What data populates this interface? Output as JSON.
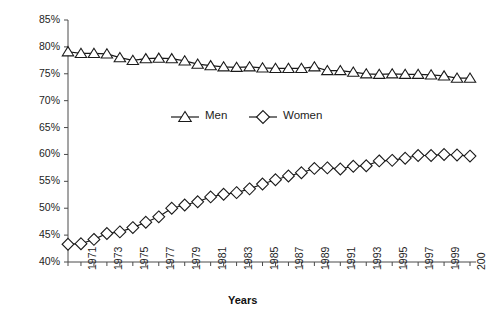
{
  "chart_data": {
    "type": "line",
    "title": "",
    "xlabel": "Years",
    "ylabel": "",
    "ylim": [
      40,
      85
    ],
    "ytick_step": 5,
    "ytick_labels": [
      "85%",
      "80%",
      "75%",
      "70%",
      "65%",
      "60%",
      "55%",
      "50%",
      "45%",
      "40%"
    ],
    "ytick_values": [
      85,
      80,
      75,
      70,
      65,
      60,
      55,
      50,
      45,
      40
    ],
    "grid": false,
    "legend_position": "upper-center-inside",
    "x": [
      1970,
      1971,
      1972,
      1973,
      1974,
      1975,
      1976,
      1977,
      1978,
      1979,
      1980,
      1981,
      1982,
      1983,
      1984,
      1985,
      1986,
      1987,
      1988,
      1989,
      1990,
      1991,
      1992,
      1993,
      1994,
      1995,
      1996,
      1997,
      1998,
      1999,
      2000,
      2001
    ],
    "xtick_labels": [
      "",
      "1971",
      "",
      "1973",
      "",
      "1975",
      "",
      "1977",
      "",
      "1979",
      "",
      "1981",
      "",
      "1983",
      "",
      "1985",
      "",
      "1987",
      "",
      "1989",
      "",
      "1991",
      "",
      "1993",
      "",
      "1995",
      "",
      "1997",
      "",
      "1999",
      "",
      "200"
    ],
    "xlim": [
      1970,
      2001
    ],
    "series": [
      {
        "name": "Men",
        "marker": "triangle",
        "color": "#1a1a1a",
        "values": [
          79.1,
          78.8,
          78.8,
          78.7,
          78.0,
          77.5,
          77.8,
          77.9,
          77.8,
          77.4,
          76.8,
          76.5,
          76.3,
          76.2,
          76.3,
          76.1,
          76.0,
          76.0,
          76.0,
          76.3,
          75.6,
          75.6,
          75.3,
          75.0,
          74.9,
          75.0,
          74.9,
          74.9,
          74.8,
          74.6,
          74.2,
          74.2
        ]
      },
      {
        "name": "Women",
        "marker": "diamond",
        "color": "#1a1a1a",
        "values": [
          43.3,
          43.4,
          44.2,
          45.3,
          45.6,
          46.4,
          47.4,
          48.4,
          50.0,
          50.6,
          51.2,
          52.1,
          52.6,
          52.9,
          53.6,
          54.5,
          55.3,
          56.0,
          56.6,
          57.4,
          57.5,
          57.3,
          57.8,
          57.9,
          58.8,
          58.9,
          59.3,
          59.8,
          59.8,
          60.0,
          59.9,
          59.7
        ]
      }
    ]
  },
  "legend": {
    "items": [
      {
        "label": "Men",
        "marker": "triangle"
      },
      {
        "label": "Women",
        "marker": "diamond"
      }
    ]
  },
  "axis": {
    "x_title": "Years"
  }
}
